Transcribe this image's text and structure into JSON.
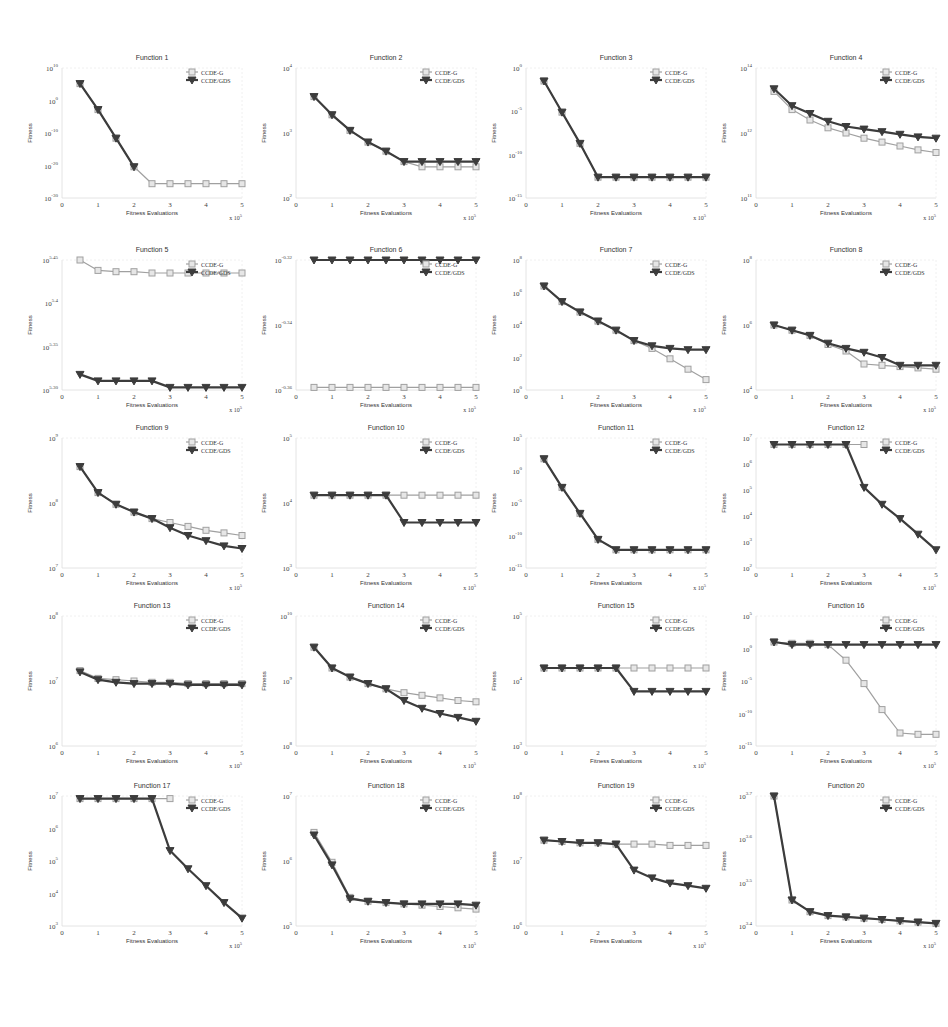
{
  "figure": {
    "caption": "",
    "legend": {
      "series_a": "CCDE-G",
      "series_b": "CCDE/GDS"
    },
    "x_label": "Fitness Evaluations",
    "y_label": "Fitness",
    "x_multiplier": "x 10^5",
    "colors": {
      "series_a": "#a0a0a0",
      "series_b": "#3c3c3c",
      "axis": "#555555"
    }
  },
  "chart_data": [
    {
      "type": "line",
      "title": "Function 1",
      "xlabel": "Fitness Evaluations",
      "ylabel": "Fitness",
      "x": [
        0.5,
        1,
        1.5,
        2,
        2.5,
        3,
        3.5,
        4,
        4.5,
        5
      ],
      "xlim": [
        0,
        5
      ],
      "yticks": [
        "10^10",
        "10^0",
        "10^-10",
        "10^-20",
        "10^-30"
      ],
      "series": [
        {
          "name": "CCDE-G",
          "values": [
            0.88,
            0.68,
            0.46,
            0.24,
            0.11,
            0.11,
            0.11,
            0.11,
            0.11,
            0.11
          ]
        },
        {
          "name": "CCDE/GDS",
          "values": [
            0.88,
            0.68,
            0.46,
            0.24,
            null,
            null,
            null,
            null,
            null,
            null
          ]
        }
      ]
    },
    {
      "type": "line",
      "title": "Function 2",
      "xlabel": "Fitness Evaluations",
      "ylabel": "Fitness",
      "x": [
        0.5,
        1,
        1.5,
        2,
        2.5,
        3,
        3.5,
        4,
        4.5,
        5
      ],
      "xlim": [
        0,
        5
      ],
      "yticks": [
        "10^4",
        "10^3",
        "10^2"
      ],
      "series": [
        {
          "name": "CCDE-G",
          "values": [
            0.78,
            0.64,
            0.52,
            0.43,
            0.36,
            0.28,
            0.24,
            0.24,
            0.24,
            0.24
          ]
        },
        {
          "name": "CCDE/GDS",
          "values": [
            0.78,
            0.64,
            0.52,
            0.43,
            0.36,
            0.28,
            0.28,
            0.28,
            0.28,
            0.28
          ]
        }
      ]
    },
    {
      "type": "line",
      "title": "Function 3",
      "xlabel": "Fitness Evaluations",
      "ylabel": "Fitness",
      "x": [
        0.5,
        1,
        1.5,
        2,
        2.5,
        3,
        3.5,
        4,
        4.5,
        5
      ],
      "xlim": [
        0,
        5
      ],
      "yticks": [
        "10^0",
        "10^-5",
        "10^-10",
        "10^-15"
      ],
      "series": [
        {
          "name": "CCDE-G",
          "values": [
            0.9,
            0.66,
            0.42,
            0.16,
            0.16,
            0.16,
            0.16,
            0.16,
            0.16,
            0.16
          ]
        },
        {
          "name": "CCDE/GDS",
          "values": [
            0.9,
            0.66,
            0.42,
            0.16,
            0.16,
            0.16,
            0.16,
            0.16,
            0.16,
            0.16
          ]
        }
      ]
    },
    {
      "type": "line",
      "title": "Function 4",
      "xlabel": "Fitness Evaluations",
      "ylabel": "Fitness",
      "x": [
        0.5,
        1,
        1.5,
        2,
        2.5,
        3,
        3.5,
        4,
        4.5,
        5
      ],
      "xlim": [
        0,
        5
      ],
      "yticks": [
        "10^14",
        "10^12",
        "10^11"
      ],
      "series": [
        {
          "name": "CCDE-G",
          "values": [
            0.82,
            0.68,
            0.6,
            0.54,
            0.5,
            0.46,
            0.43,
            0.4,
            0.37,
            0.35
          ]
        },
        {
          "name": "CCDE/GDS",
          "values": [
            0.84,
            0.71,
            0.65,
            0.59,
            0.55,
            0.53,
            0.51,
            0.49,
            0.47,
            0.46
          ]
        }
      ]
    },
    {
      "type": "line",
      "title": "Function 5",
      "xlabel": "Fitness Evaluations",
      "ylabel": "Fitness",
      "x": [
        0.5,
        1,
        1.5,
        2,
        2.5,
        3,
        3.5,
        4,
        4.5,
        5
      ],
      "xlim": [
        0,
        5
      ],
      "yticks": [
        "10^5.45",
        "10^5.4",
        "10^5.35",
        "10^5.30"
      ],
      "series": [
        {
          "name": "CCDE-G",
          "values": [
            1.0,
            0.92,
            0.91,
            0.91,
            0.9,
            0.9,
            0.9,
            0.9,
            0.9,
            0.9
          ]
        },
        {
          "name": "CCDE/GDS",
          "values": [
            0.12,
            0.07,
            0.07,
            0.07,
            0.07,
            0.02,
            0.02,
            0.02,
            0.02,
            0.02
          ]
        }
      ]
    },
    {
      "type": "line",
      "title": "Function 6",
      "xlabel": "Fitness Evaluations",
      "ylabel": "Fitness",
      "x": [
        0.5,
        1,
        1.5,
        2,
        2.5,
        3,
        3.5,
        4,
        4.5,
        5
      ],
      "xlim": [
        0,
        5
      ],
      "yticks": [
        "10^-0.32",
        "10^-0.34",
        "10^-0.36"
      ],
      "series": [
        {
          "name": "CCDE-G",
          "values": [
            0.02,
            0.02,
            0.02,
            0.02,
            0.02,
            0.02,
            0.02,
            0.02,
            0.02,
            0.02
          ]
        },
        {
          "name": "CCDE/GDS",
          "values": [
            1.0,
            1.0,
            1.0,
            1.0,
            1.0,
            1.0,
            1.0,
            1.0,
            1.0,
            1.0
          ]
        }
      ]
    },
    {
      "type": "line",
      "title": "Function 7",
      "xlabel": "Fitness Evaluations",
      "ylabel": "Fitness",
      "x": [
        0.5,
        1,
        1.5,
        2,
        2.5,
        3,
        3.5,
        4,
        4.5,
        5
      ],
      "xlim": [
        0,
        5
      ],
      "yticks": [
        "10^8",
        "10^6",
        "10^4",
        "10^2",
        "10^0"
      ],
      "series": [
        {
          "name": "CCDE-G",
          "values": [
            0.8,
            0.68,
            0.6,
            0.53,
            0.46,
            0.38,
            0.32,
            0.24,
            0.16,
            0.08
          ]
        },
        {
          "name": "CCDE/GDS",
          "values": [
            0.8,
            0.68,
            0.6,
            0.53,
            0.46,
            0.38,
            0.34,
            0.32,
            0.31,
            0.31
          ]
        }
      ]
    },
    {
      "type": "line",
      "title": "Function 8",
      "xlabel": "Fitness Evaluations",
      "ylabel": "Fitness",
      "x": [
        0.5,
        1,
        1.5,
        2,
        2.5,
        3,
        3.5,
        4,
        4.5,
        5
      ],
      "xlim": [
        0,
        5
      ],
      "yticks": [
        "10^8",
        "10^6",
        "10^4"
      ],
      "series": [
        {
          "name": "CCDE-G",
          "values": [
            0.5,
            0.46,
            0.42,
            0.35,
            0.3,
            0.2,
            0.19,
            0.18,
            0.17,
            0.16
          ]
        },
        {
          "name": "CCDE/GDS",
          "values": [
            0.5,
            0.46,
            0.42,
            0.36,
            0.32,
            0.29,
            0.25,
            0.19,
            0.19,
            0.19
          ]
        }
      ]
    },
    {
      "type": "line",
      "title": "Function 9",
      "xlabel": "Fitness Evaluations",
      "ylabel": "Fitness",
      "x": [
        0.5,
        1,
        1.5,
        2,
        2.5,
        3,
        3.5,
        4,
        4.5,
        5
      ],
      "xlim": [
        0,
        5
      ],
      "yticks": [
        "10^9",
        "10^8",
        "10^7"
      ],
      "series": [
        {
          "name": "CCDE-G",
          "values": [
            0.78,
            0.58,
            0.49,
            0.43,
            0.38,
            0.35,
            0.32,
            0.29,
            0.27,
            0.25
          ]
        },
        {
          "name": "CCDE/GDS",
          "values": [
            0.78,
            0.58,
            0.49,
            0.43,
            0.38,
            0.31,
            0.25,
            0.21,
            0.17,
            0.15
          ]
        }
      ]
    },
    {
      "type": "line",
      "title": "Function 10",
      "xlabel": "Fitness Evaluations",
      "ylabel": "Fitness",
      "x": [
        0.5,
        1,
        1.5,
        2,
        2.5,
        3,
        3.5,
        4,
        4.5,
        5
      ],
      "xlim": [
        0,
        5
      ],
      "yticks": [
        "10^5",
        "10^4",
        "10^3"
      ],
      "series": [
        {
          "name": "CCDE-G",
          "values": [
            0.56,
            0.56,
            0.56,
            0.56,
            0.56,
            0.56,
            0.56,
            0.56,
            0.56,
            0.56
          ]
        },
        {
          "name": "CCDE/GDS",
          "values": [
            0.56,
            0.56,
            0.56,
            0.56,
            0.56,
            0.35,
            0.35,
            0.35,
            0.35,
            0.35
          ]
        }
      ]
    },
    {
      "type": "line",
      "title": "Function 11",
      "xlabel": "Fitness Evaluations",
      "ylabel": "Fitness",
      "x": [
        0.5,
        1,
        1.5,
        2,
        2.5,
        3,
        3.5,
        4,
        4.5,
        5
      ],
      "xlim": [
        0,
        5
      ],
      "yticks": [
        "10^5",
        "10^0",
        "10^-5",
        "10^-10",
        "10^-15"
      ],
      "series": [
        {
          "name": "CCDE-G",
          "values": [
            0.84,
            0.62,
            0.42,
            0.22,
            0.14,
            0.14,
            0.14,
            0.14,
            0.14,
            0.14
          ]
        },
        {
          "name": "CCDE/GDS",
          "values": [
            0.84,
            0.62,
            0.42,
            0.22,
            0.14,
            0.14,
            0.14,
            0.14,
            0.14,
            0.14
          ]
        }
      ]
    },
    {
      "type": "line",
      "title": "Function 12",
      "xlabel": "Fitness Evaluations",
      "ylabel": "Fitness",
      "x": [
        0.5,
        1,
        1.5,
        2,
        2.5,
        3,
        3.5,
        4,
        4.5,
        5
      ],
      "xlim": [
        0,
        5
      ],
      "yticks": [
        "10^7",
        "10^6",
        "10^5",
        "10^4",
        "10^3",
        "10^2"
      ],
      "series": [
        {
          "name": "CCDE-G",
          "values": [
            0.95,
            0.95,
            0.95,
            0.95,
            0.95,
            0.95,
            null,
            null,
            null,
            null
          ]
        },
        {
          "name": "CCDE/GDS",
          "values": [
            0.95,
            0.95,
            0.95,
            0.95,
            0.95,
            0.62,
            0.49,
            0.38,
            0.26,
            0.14
          ]
        }
      ]
    },
    {
      "type": "line",
      "title": "Function 13",
      "xlabel": "Fitness Evaluations",
      "ylabel": "Fitness",
      "x": [
        0.5,
        1,
        1.5,
        2,
        2.5,
        3,
        3.5,
        4,
        4.5,
        5
      ],
      "xlim": [
        0,
        5
      ],
      "yticks": [
        "10^8",
        "10^7",
        "10^6"
      ],
      "series": [
        {
          "name": "CCDE-G",
          "values": [
            0.58,
            0.52,
            0.51,
            0.5,
            0.49,
            0.49,
            0.48,
            0.48,
            0.48,
            0.48
          ]
        },
        {
          "name": "CCDE/GDS",
          "values": [
            0.57,
            0.51,
            0.49,
            0.48,
            0.48,
            0.48,
            0.47,
            0.47,
            0.47,
            0.47
          ]
        }
      ]
    },
    {
      "type": "line",
      "title": "Function 14",
      "xlabel": "Fitness Evaluations",
      "ylabel": "Fitness",
      "x": [
        0.5,
        1,
        1.5,
        2,
        2.5,
        3,
        3.5,
        4,
        4.5,
        5
      ],
      "xlim": [
        0,
        5
      ],
      "yticks": [
        "10^10",
        "10^9",
        "10^8"
      ],
      "series": [
        {
          "name": "CCDE-G",
          "values": [
            0.76,
            0.6,
            0.53,
            0.48,
            0.44,
            0.41,
            0.39,
            0.37,
            0.35,
            0.34
          ]
        },
        {
          "name": "CCDE/GDS",
          "values": [
            0.76,
            0.6,
            0.53,
            0.48,
            0.44,
            0.35,
            0.29,
            0.25,
            0.22,
            0.19
          ]
        }
      ]
    },
    {
      "type": "line",
      "title": "Function 15",
      "xlabel": "Fitness Evaluations",
      "ylabel": "Fitness",
      "x": [
        0.5,
        1,
        1.5,
        2,
        2.5,
        3,
        3.5,
        4,
        4.5,
        5
      ],
      "xlim": [
        0,
        5
      ],
      "yticks": [
        "10^5",
        "10^4",
        "10^3"
      ],
      "series": [
        {
          "name": "CCDE-G",
          "values": [
            0.6,
            0.6,
            0.6,
            0.6,
            0.6,
            0.6,
            0.6,
            0.6,
            0.6,
            0.6
          ]
        },
        {
          "name": "CCDE/GDS",
          "values": [
            0.6,
            0.6,
            0.6,
            0.6,
            0.6,
            0.42,
            0.42,
            0.42,
            0.42,
            0.42
          ]
        }
      ]
    },
    {
      "type": "line",
      "title": "Function 16",
      "xlabel": "Fitness Evaluations",
      "ylabel": "Fitness",
      "x": [
        0.5,
        1,
        1.5,
        2,
        2.5,
        3,
        3.5,
        4,
        4.5,
        5
      ],
      "xlim": [
        0,
        5
      ],
      "yticks": [
        "10^5",
        "10^0",
        "10^-5",
        "10^-10",
        "10^-15"
      ],
      "series": [
        {
          "name": "CCDE-G",
          "values": [
            0.8,
            0.79,
            0.79,
            0.78,
            0.66,
            0.48,
            0.28,
            0.1,
            0.09,
            0.09
          ]
        },
        {
          "name": "CCDE/GDS",
          "values": [
            0.8,
            0.78,
            0.78,
            0.78,
            0.78,
            0.78,
            0.78,
            0.78,
            0.78,
            0.78
          ]
        }
      ]
    },
    {
      "type": "line",
      "title": "Function 17",
      "xlabel": "Fitness Evaluations",
      "ylabel": "Fitness",
      "x": [
        0.5,
        1,
        1.5,
        2,
        2.5,
        3,
        3.5,
        4,
        4.5,
        5
      ],
      "xlim": [
        0,
        5
      ],
      "yticks": [
        "10^7",
        "10^6",
        "10^5",
        "10^4",
        "10^3"
      ],
      "series": [
        {
          "name": "CCDE-G",
          "values": [
            0.98,
            0.98,
            0.98,
            0.98,
            0.98,
            0.98,
            null,
            null,
            null,
            null
          ]
        },
        {
          "name": "CCDE/GDS",
          "values": [
            0.98,
            0.98,
            0.98,
            0.98,
            0.98,
            0.58,
            0.44,
            0.31,
            0.18,
            0.06
          ]
        }
      ]
    },
    {
      "type": "line",
      "title": "Function 18",
      "xlabel": "Fitness Evaluations",
      "ylabel": "Fitness",
      "x": [
        0.5,
        1,
        1.5,
        2,
        2.5,
        3,
        3.5,
        4,
        4.5,
        5
      ],
      "xlim": [
        0,
        5
      ],
      "yticks": [
        "10^7",
        "10^6",
        "10^5"
      ],
      "series": [
        {
          "name": "CCDE-G",
          "values": [
            0.72,
            0.49,
            0.22,
            0.19,
            0.18,
            0.17,
            0.16,
            0.15,
            0.14,
            0.13
          ]
        },
        {
          "name": "CCDE/GDS",
          "values": [
            0.7,
            0.47,
            0.21,
            0.19,
            0.18,
            0.17,
            0.17,
            0.17,
            0.17,
            0.16
          ]
        }
      ]
    },
    {
      "type": "line",
      "title": "Function 19",
      "xlabel": "Fitness Evaluations",
      "ylabel": "Fitness",
      "x": [
        0.5,
        1,
        1.5,
        2,
        2.5,
        3,
        3.5,
        4,
        4.5,
        5
      ],
      "xlim": [
        0,
        5
      ],
      "yticks": [
        "10^8",
        "10^7",
        "10^6"
      ],
      "series": [
        {
          "name": "CCDE-G",
          "values": [
            0.66,
            0.65,
            0.64,
            0.64,
            0.63,
            0.63,
            0.63,
            0.62,
            0.62,
            0.62
          ]
        },
        {
          "name": "CCDE/GDS",
          "values": [
            0.66,
            0.65,
            0.64,
            0.64,
            0.63,
            0.43,
            0.37,
            0.33,
            0.31,
            0.29
          ]
        }
      ]
    },
    {
      "type": "line",
      "title": "Function 20",
      "xlabel": "Fitness Evaluations",
      "ylabel": "Fitness",
      "x": [
        0.5,
        1,
        1.5,
        2,
        2.5,
        3,
        3.5,
        4,
        4.5,
        5
      ],
      "xlim": [
        0,
        5
      ],
      "yticks": [
        "10^3.7",
        "10^3.6",
        "10^3.5",
        "10^3.4"
      ],
      "series": [
        {
          "name": "CCDE-G",
          "values": [
            1.0,
            0.2,
            0.11,
            0.08,
            0.07,
            0.06,
            0.05,
            0.04,
            0.03,
            0.02
          ]
        },
        {
          "name": "CCDE/GDS",
          "values": [
            1.0,
            0.2,
            0.11,
            0.08,
            0.07,
            0.06,
            0.05,
            0.04,
            0.03,
            0.02
          ]
        }
      ]
    }
  ]
}
